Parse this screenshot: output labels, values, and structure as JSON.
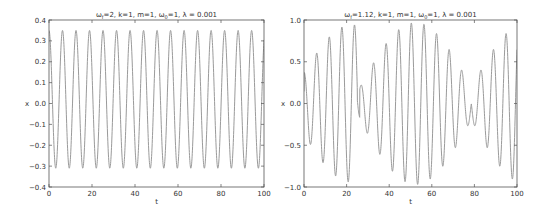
{
  "colors": {
    "line": "#9a9a9a",
    "axis": "#555555",
    "text": "#333333"
  },
  "chart_data": [
    {
      "type": "line",
      "title": "ω_f=2, k=1, m=1, ω_0=1,  λ=0.001",
      "title_parts": {
        "w": "ω",
        "f_sub": "f",
        "a": "=2, k=1, m=1, ",
        "w0": "ω",
        "zero_sub": "0",
        "b": "=1,  λ = 0.001"
      },
      "xlabel": "t",
      "ylabel": "x",
      "xlim": [
        0,
        100
      ],
      "ylim": [
        -0.4,
        0.4
      ],
      "xticks": [
        0,
        20,
        40,
        60,
        80,
        100
      ],
      "yticks": [
        -0.4,
        -0.3,
        -0.2,
        -0.1,
        0.0,
        0.1,
        0.2,
        0.3,
        0.4
      ],
      "ytick_labels": [
        "−0.4",
        "−0.3",
        "−0.2",
        "−0.1",
        "0.0",
        "0.1",
        "0.2",
        "0.3",
        "0.4"
      ],
      "grid": false,
      "model": {
        "kind": "steady",
        "amp": 0.33,
        "offset": 0.02,
        "omega": 1.0,
        "phase": 0.0
      },
      "series": [
        {
          "name": "x(t)",
          "peaks_approx": [
            0.35,
            0.35,
            0.35,
            0.35,
            0.35,
            0.35,
            0.35,
            0.34,
            0.34,
            0.34,
            0.34,
            0.34,
            0.34,
            0.34,
            0.34,
            0.34
          ],
          "troughs_approx": [
            -0.31,
            -0.31,
            -0.31,
            -0.31,
            -0.31,
            -0.31,
            -0.31,
            -0.31,
            -0.31,
            -0.31,
            -0.31,
            -0.31,
            -0.31,
            -0.31,
            -0.31,
            -0.3
          ]
        }
      ]
    },
    {
      "type": "line",
      "title": "ω_f=1.12, k=1, m=1, ω_0=1,  λ=0.001",
      "title_parts": {
        "w": "ω",
        "f_sub": "f",
        "a": "=1.12, k=1, m=1, ",
        "w0": "ω",
        "zero_sub": "0",
        "b": "=1,  λ = 0.001"
      },
      "xlabel": "t",
      "ylabel": "x",
      "xlim": [
        0,
        100
      ],
      "ylim": [
        -1.0,
        1.0
      ],
      "xticks": [
        0,
        20,
        40,
        60,
        80,
        100
      ],
      "yticks": [
        -1.0,
        -0.5,
        0.0,
        0.5,
        1.0
      ],
      "ytick_labels": [
        "−1.0",
        "−0.5",
        "0.0",
        "0.5",
        "1.0"
      ],
      "grid": false,
      "model": {
        "kind": "beat",
        "amp": 0.97,
        "omega_f": 1.12,
        "omega_0": 1.0,
        "envelope_min": 0.2
      },
      "series": [
        {
          "name": "x(t)",
          "peaks_approx": [
            0.37,
            0.65,
            0.85,
            0.95,
            0.93,
            0.8,
            0.57,
            0.28,
            0.27,
            0.55,
            0.78,
            0.92,
            0.94,
            0.85,
            0.64,
            0.37
          ],
          "troughs_approx": [
            -0.52,
            -0.77,
            -0.92,
            -0.97,
            -0.88,
            -0.7,
            -0.43,
            -0.18,
            -0.42,
            -0.68,
            -0.87,
            -0.96,
            -0.91,
            -0.76,
            -0.52,
            -0.22
          ]
        }
      ]
    }
  ]
}
